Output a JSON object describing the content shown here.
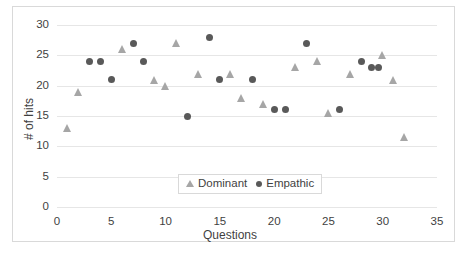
{
  "chart_data": {
    "type": "scatter",
    "title": "",
    "xlabel": "Questions",
    "ylabel": "# of hits",
    "xlim": [
      0,
      35
    ],
    "ylim": [
      0,
      30
    ],
    "xticks": [
      0,
      5,
      10,
      15,
      20,
      25,
      30,
      35
    ],
    "yticks": [
      0,
      5,
      10,
      15,
      20,
      25,
      30
    ],
    "grid": true,
    "legend_position": "lower-center",
    "colors": {
      "dominant": "#a6a6a6",
      "empathic": "#595959",
      "grid": "#e6e6e6",
      "border": "#d9d9d9",
      "text": "#3f3f3f"
    },
    "series": [
      {
        "name": "Dominant",
        "marker": "triangle",
        "color": "#a6a6a6",
        "points": [
          {
            "x": 1,
            "y": 13
          },
          {
            "x": 2,
            "y": 19
          },
          {
            "x": 6,
            "y": 26
          },
          {
            "x": 9,
            "y": 21
          },
          {
            "x": 10,
            "y": 20
          },
          {
            "x": 11,
            "y": 27
          },
          {
            "x": 13,
            "y": 22
          },
          {
            "x": 16,
            "y": 22
          },
          {
            "x": 17,
            "y": 18
          },
          {
            "x": 19,
            "y": 17
          },
          {
            "x": 22,
            "y": 23
          },
          {
            "x": 24,
            "y": 24
          },
          {
            "x": 25,
            "y": 15.5
          },
          {
            "x": 27,
            "y": 22
          },
          {
            "x": 30,
            "y": 25
          },
          {
            "x": 31,
            "y": 21
          },
          {
            "x": 32,
            "y": 11.5
          }
        ]
      },
      {
        "name": "Empathic",
        "marker": "circle",
        "color": "#595959",
        "points": [
          {
            "x": 3,
            "y": 24
          },
          {
            "x": 4,
            "y": 24
          },
          {
            "x": 5,
            "y": 21
          },
          {
            "x": 7,
            "y": 27
          },
          {
            "x": 8,
            "y": 24
          },
          {
            "x": 12,
            "y": 15
          },
          {
            "x": 14,
            "y": 28
          },
          {
            "x": 15,
            "y": 21
          },
          {
            "x": 18,
            "y": 21
          },
          {
            "x": 20,
            "y": 16
          },
          {
            "x": 21,
            "y": 16
          },
          {
            "x": 23,
            "y": 27
          },
          {
            "x": 26,
            "y": 16
          },
          {
            "x": 28,
            "y": 24
          },
          {
            "x": 29,
            "y": 23
          },
          {
            "x": 29.6,
            "y": 23
          }
        ]
      }
    ]
  },
  "legend": {
    "dominant_label": "Dominant",
    "empathic_label": "Empathic"
  },
  "axes": {
    "x_title": "Questions",
    "y_title": "# of hits"
  }
}
